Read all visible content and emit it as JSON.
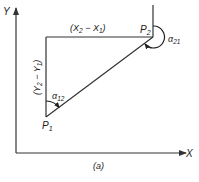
{
  "figure": {
    "caption": "(a)",
    "axes": {
      "x_label": "X",
      "y_label": "Y"
    },
    "points": {
      "p1": {
        "main": "P",
        "sub": "1"
      },
      "p2": {
        "main": "P",
        "sub": "2"
      }
    },
    "segments": {
      "horizontal": {
        "open": "(X",
        "sub_a": "2",
        "mid": " − X",
        "sub_b": "1",
        "close": ")"
      },
      "vertical": {
        "open": "(Y",
        "sub_a": "2",
        "mid": " − Y",
        "sub_b": "1",
        "close": ")"
      }
    },
    "angles": {
      "alpha12": {
        "main": "α",
        "sub": "12"
      },
      "alpha21": {
        "main": "α",
        "sub": "21"
      }
    },
    "colors": {
      "line": "#333333",
      "background": "#ffffff"
    }
  }
}
